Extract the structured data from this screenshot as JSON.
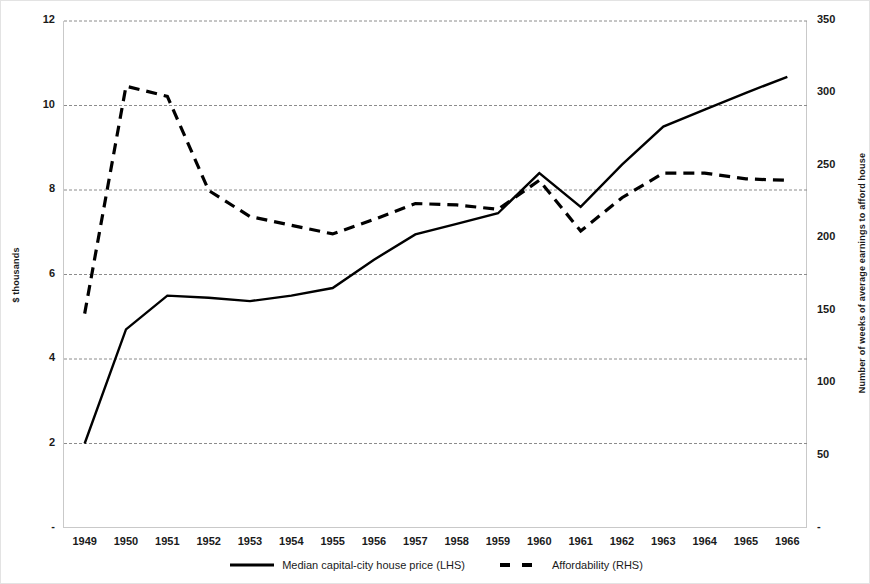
{
  "chart_data": {
    "type": "line",
    "title": "",
    "xlabel": "",
    "ylabel": "$ thousands",
    "y2label": "Number of weeks of average earnings to afford house",
    "x": [
      1949,
      1950,
      1951,
      1952,
      1953,
      1954,
      1955,
      1956,
      1957,
      1958,
      1959,
      1960,
      1961,
      1962,
      1963,
      1964,
      1965,
      1966
    ],
    "categories": [
      "1949",
      "1950",
      "1951",
      "1952",
      "1953",
      "1954",
      "1955",
      "1956",
      "1957",
      "1958",
      "1959",
      "1960",
      "1961",
      "1962",
      "1963",
      "1964",
      "1965",
      "1966"
    ],
    "ylim": [
      0,
      12
    ],
    "y2lim": [
      0,
      350
    ],
    "yticks": [
      "-",
      "2",
      "4",
      "6",
      "8",
      "10",
      "12"
    ],
    "ytick_values": [
      0,
      2,
      4,
      6,
      8,
      10,
      12
    ],
    "y2ticks": [
      "-",
      "50",
      "100",
      "150",
      "200",
      "250",
      "300",
      "350"
    ],
    "y2tick_values": [
      0,
      50,
      100,
      150,
      200,
      250,
      300,
      350
    ],
    "grid": true,
    "grid_style": "dashed-horizontal",
    "legend_position": "bottom",
    "series": [
      {
        "name": "Median capital-city house price (LHS)",
        "axis": "left",
        "style": "solid",
        "color": "#000000",
        "values": [
          2.0,
          4.7,
          5.5,
          5.45,
          5.37,
          5.5,
          5.68,
          6.35,
          6.95,
          7.2,
          7.45,
          8.4,
          7.6,
          8.6,
          9.5,
          9.9,
          10.3,
          10.68
        ]
      },
      {
        "name": "Affordability (RHS)",
        "axis": "right",
        "style": "dashed",
        "color": "#000000",
        "values": [
          148,
          305,
          298,
          233,
          215,
          209,
          203,
          213,
          224,
          223,
          220,
          240,
          205,
          228,
          245,
          245,
          241,
          240
        ]
      }
    ]
  },
  "legend": {
    "entries": [
      {
        "label": "Median capital-city house price (LHS)",
        "style": "solid"
      },
      {
        "label": "Affordability (RHS)",
        "style": "dashed"
      }
    ]
  }
}
